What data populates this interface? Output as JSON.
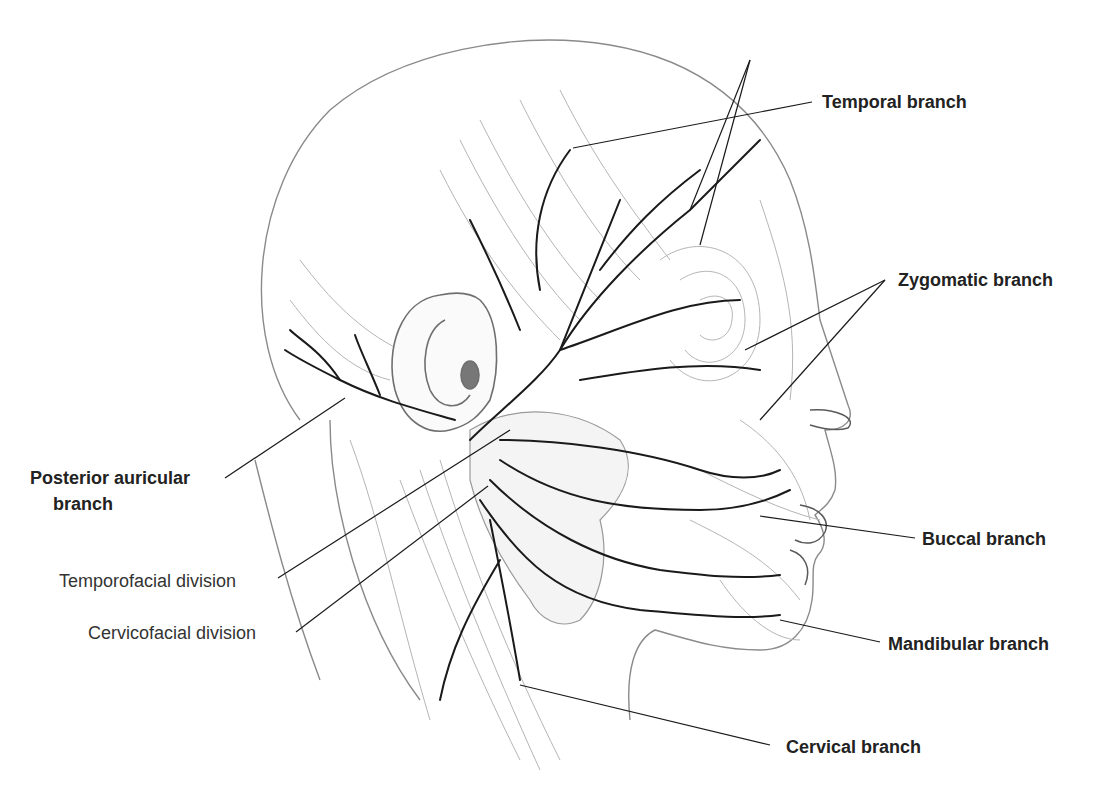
{
  "diagram": {
    "labels": [
      {
        "id": "temporal",
        "text": "Temporal branch",
        "weight": "bold"
      },
      {
        "id": "zygomatic",
        "text": "Zygomatic branch",
        "weight": "bold"
      },
      {
        "id": "posterior_auricular_line1",
        "text": "Posterior auricular",
        "weight": "bold"
      },
      {
        "id": "posterior_auricular_line2",
        "text": "branch",
        "weight": "bold"
      },
      {
        "id": "temporofacial",
        "text": "Temporofacial division",
        "weight": "regular"
      },
      {
        "id": "cervicofacial",
        "text": "Cervicofacial division",
        "weight": "regular"
      },
      {
        "id": "buccal",
        "text": "Buccal branch",
        "weight": "bold"
      },
      {
        "id": "mandibular",
        "text": "Mandibular branch",
        "weight": "bold"
      },
      {
        "id": "cervical",
        "text": "Cervical branch",
        "weight": "bold"
      }
    ]
  },
  "colors": {
    "background": "#ffffff",
    "nerve": "#1a1a1a",
    "outline": "#8a8a8a",
    "muscle": "#b5b5b5",
    "label": "#222222"
  }
}
